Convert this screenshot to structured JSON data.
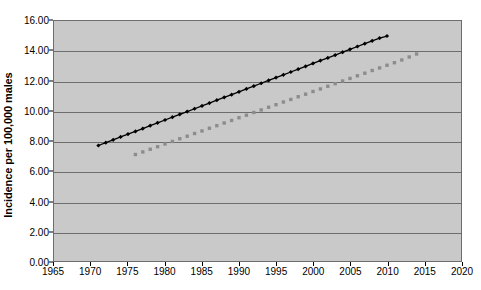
{
  "chart_data": {
    "type": "line",
    "title": "",
    "xlabel": "",
    "ylabel": "Incidence per 100,000 males",
    "xlim": [
      1965,
      2020
    ],
    "ylim": [
      0.0,
      16.0
    ],
    "grid": true,
    "legend": "none",
    "x_ticks": [
      "1965",
      "1970",
      "1975",
      "1980",
      "1985",
      "1990",
      "1995",
      "2000",
      "2005",
      "2010",
      "2015",
      "2020"
    ],
    "x_tick_values": [
      1965,
      1970,
      1975,
      1980,
      1985,
      1990,
      1995,
      2000,
      2005,
      2010,
      2015,
      2020
    ],
    "y_ticks": [
      "0.00",
      "2.00",
      "4.00",
      "6.00",
      "8.00",
      "10.00",
      "12.00",
      "14.00",
      "16.00"
    ],
    "y_tick_values": [
      0,
      2,
      4,
      6,
      8,
      10,
      12,
      14,
      16
    ],
    "series": [
      {
        "name": "observed-incidence",
        "style": "line-with-markers",
        "color": "#000000",
        "marker": "diamond",
        "x": [
          1971,
          1972,
          1973,
          1974,
          1975,
          1976,
          1977,
          1978,
          1979,
          1980,
          1981,
          1982,
          1983,
          1984,
          1985,
          1986,
          1987,
          1988,
          1989,
          1990,
          1991,
          1992,
          1993,
          1994,
          1995,
          1996,
          1997,
          1998,
          1999,
          2000,
          2001,
          2002,
          2003,
          2004,
          2005,
          2006,
          2007,
          2008,
          2009,
          2010
        ],
        "values": [
          7.7,
          7.89,
          8.08,
          8.27,
          8.46,
          8.64,
          8.83,
          9.02,
          9.21,
          9.4,
          9.59,
          9.78,
          9.96,
          10.15,
          10.34,
          10.53,
          10.72,
          10.91,
          11.09,
          11.28,
          11.47,
          11.66,
          11.85,
          12.04,
          12.23,
          12.41,
          12.6,
          12.79,
          12.98,
          13.17,
          13.36,
          13.54,
          13.73,
          13.92,
          14.11,
          14.3,
          14.49,
          14.68,
          14.86,
          15.0
        ]
      },
      {
        "name": "projected-incidence",
        "style": "markers-only",
        "color": "#8c8c8c",
        "marker": "square",
        "x": [
          1976,
          1977,
          1978,
          1979,
          1980,
          1981,
          1982,
          1983,
          1984,
          1985,
          1986,
          1987,
          1988,
          1989,
          1990,
          1991,
          1992,
          1993,
          1994,
          1995,
          1996,
          1997,
          1998,
          1999,
          2000,
          2001,
          2002,
          2003,
          2004,
          2005,
          2006,
          2007,
          2008,
          2009,
          2010,
          2011,
          2012,
          2013,
          2014
        ],
        "values": [
          7.1,
          7.27,
          7.45,
          7.62,
          7.8,
          7.97,
          8.15,
          8.32,
          8.5,
          8.67,
          8.85,
          9.02,
          9.2,
          9.37,
          9.55,
          9.72,
          9.9,
          10.07,
          10.25,
          10.42,
          10.6,
          10.77,
          10.95,
          11.12,
          11.3,
          11.47,
          11.65,
          11.82,
          12.0,
          12.17,
          12.35,
          12.52,
          12.7,
          12.87,
          13.05,
          13.22,
          13.4,
          13.6,
          13.8
        ]
      }
    ]
  },
  "colors": {
    "plot_background": "#c9c9c9",
    "gridline": "#6d6d6d",
    "axis": "#000000",
    "series_primary": "#000000",
    "series_secondary": "#8c8c8c",
    "page_background": "#ffffff"
  }
}
